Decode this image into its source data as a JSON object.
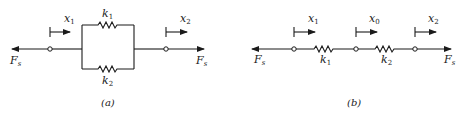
{
  "diagram_a": {
    "caption": "(a)",
    "description": "Two springs in parallel",
    "springs": [
      {
        "label": "k",
        "sub": "1",
        "position": "top"
      },
      {
        "label": "k",
        "sub": "2",
        "position": "bottom"
      }
    ],
    "displacements": [
      {
        "label": "x",
        "sub": "1"
      },
      {
        "label": "x",
        "sub": "2"
      }
    ],
    "forces": [
      {
        "label": "F",
        "sub": "s",
        "side": "left"
      },
      {
        "label": "F",
        "sub": "s",
        "side": "right"
      }
    ]
  },
  "diagram_b": {
    "caption": "(b)",
    "description": "Two springs in series",
    "springs": [
      {
        "label": "k",
        "sub": "1"
      },
      {
        "label": "k",
        "sub": "2"
      }
    ],
    "displacements": [
      {
        "label": "x",
        "sub": "1"
      },
      {
        "label": "x",
        "sub": "0"
      },
      {
        "label": "x",
        "sub": "2"
      }
    ],
    "forces": [
      {
        "label": "F",
        "sub": "s",
        "side": "left"
      },
      {
        "label": "F",
        "sub": "s",
        "side": "right"
      }
    ]
  },
  "colors": {
    "ink": "#1a1a1a",
    "background": "#ffffff"
  }
}
